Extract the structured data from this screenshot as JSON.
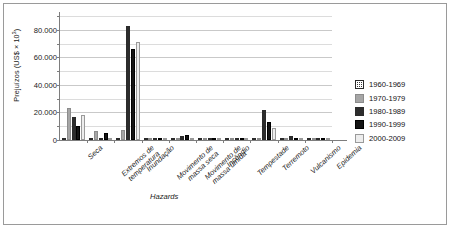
{
  "chart_data": {
    "type": "bar",
    "title": "",
    "xlabel": "Hazards",
    "ylabel": "Prejuízos (US$ × 10³)",
    "ylabel_base": "Prejuízos (US$ × 10",
    "ylabel_exp": "3",
    "ylabel_tail": ")",
    "ylim": [
      0,
      90000
    ],
    "grid": true,
    "legend_position": "right",
    "ytick_labels": [
      "0",
      "20.000",
      "40.000",
      "60.000",
      "80.000"
    ],
    "ytick_values": [
      0,
      20000,
      40000,
      60000,
      80000
    ],
    "minor_tick_values": [
      10000,
      30000,
      50000,
      70000,
      90000
    ],
    "categories": [
      "Seca",
      "Extremos de\ntemperatura",
      "Inundação",
      "Movimento de\nmassa seca",
      "Movimento de\nmassa úmida",
      "Incêndio",
      "Tempestade",
      "Terremoto",
      "Vulcanismo",
      "Epidemia"
    ],
    "series": [
      {
        "name": "1960-1969",
        "pattern": "dark-crosshatch",
        "values": [
          1200,
          0,
          0,
          0,
          0,
          0,
          0,
          0,
          0,
          0
        ]
      },
      {
        "name": "1970-1979",
        "pattern": "gray-solid",
        "values": [
          23000,
          6500,
          7000,
          0,
          0,
          0,
          0,
          700,
          0,
          0
        ]
      },
      {
        "name": "1980-1989",
        "pattern": "dotted-grid",
        "values": [
          17000,
          1000,
          83000,
          1800,
          2800,
          0,
          0,
          22000,
          3200,
          0
        ]
      },
      {
        "name": "1990-1999",
        "pattern": "black-solid",
        "values": [
          10000,
          5400,
          66000,
          0,
          3400,
          0,
          400,
          13000,
          0,
          0
        ]
      },
      {
        "name": "2000-2009",
        "pattern": "light-hlines",
        "values": [
          18000,
          600,
          71000,
          0,
          0,
          0,
          1600,
          9000,
          600,
          0
        ]
      }
    ]
  }
}
